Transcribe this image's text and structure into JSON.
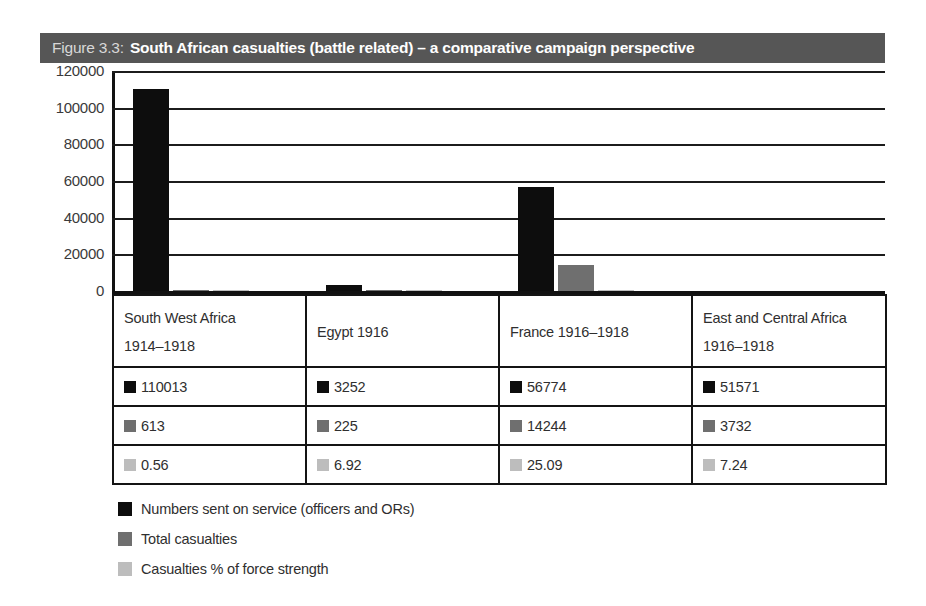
{
  "figure": {
    "number_label": "Figure 3.3:",
    "title": "South African casualties (battle related) – a comparative campaign perspective",
    "title_bar_color": "#565656"
  },
  "chart_data": {
    "type": "bar",
    "title": "South African casualties (battle related) – a comparative campaign perspective",
    "xlabel": "",
    "ylabel": "",
    "ylim": [
      0,
      120000
    ],
    "ytick_values": [
      120000,
      100000,
      80000,
      60000,
      40000,
      20000,
      0
    ],
    "ytick_labels": [
      "120000",
      "100000",
      "80000",
      "60000",
      "40000",
      "20000",
      "0"
    ],
    "grid": true,
    "legend_position": "below",
    "categories": [
      "South West Africa 1914–1918",
      "Egypt 1916",
      "France 1916–1918",
      "East and Central Africa 1916–1918"
    ],
    "series": [
      {
        "name": "Numbers sent on service (officers and ORs)",
        "color": "#0d0d0d",
        "values": [
          110013,
          3252,
          56774,
          51571
        ]
      },
      {
        "name": "Total casualties",
        "color": "#6f6f6f",
        "values": [
          613,
          225,
          14244,
          3732
        ]
      },
      {
        "name": "Casualties % of force strength",
        "color": "#bdbdbd",
        "values": [
          0.56,
          6.92,
          25.09,
          7.24
        ]
      }
    ]
  },
  "table": {
    "headers": [
      {
        "line1": "South West Africa",
        "line2": "1914–1918"
      },
      {
        "line1": "Egypt 1916",
        "line2": ""
      },
      {
        "line1": "France 1916–1918",
        "line2": ""
      },
      {
        "line1": "East and Central Africa",
        "line2": "1916–1918"
      }
    ],
    "rows": [
      {
        "series": "Numbers sent on service (officers and ORs)",
        "color": "#0d0d0d",
        "cells": [
          "110013",
          "3252",
          "56774",
          "51571"
        ]
      },
      {
        "series": "Total casualties",
        "color": "#6f6f6f",
        "cells": [
          "613",
          "225",
          "14244",
          "3732"
        ]
      },
      {
        "series": "Casualties % of force strength",
        "color": "#bdbdbd",
        "cells": [
          "0.56",
          "6.92",
          "25.09",
          "7.24"
        ]
      }
    ]
  },
  "legend": {
    "items": [
      {
        "label": "Numbers sent on service (officers and ORs)",
        "color": "#0d0d0d",
        "swatch": "legend-swatch-black"
      },
      {
        "label": "Total casualties",
        "color": "#6f6f6f",
        "swatch": "legend-swatch-dark-gray"
      },
      {
        "label": "Casualties % of force strength",
        "color": "#bdbdbd",
        "swatch": "legend-swatch-light-gray"
      }
    ]
  }
}
